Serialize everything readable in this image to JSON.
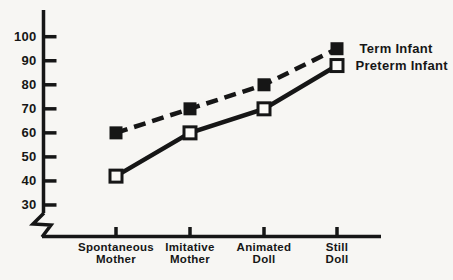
{
  "figure": {
    "background_color": "#f7f6f3",
    "ink_color": "#161616",
    "open_marker_fill": "#fbfaf7"
  },
  "chart_data": {
    "type": "line",
    "title": "",
    "xlabel": "",
    "ylabel": "",
    "categories": [
      "Spontaneous Mother",
      "Imitative Mother",
      "Animated Doll",
      "Still Doll"
    ],
    "category_label_lines": [
      [
        "Spontaneous",
        "Mother"
      ],
      [
        "Imitative",
        "Mother"
      ],
      [
        "Animated",
        "Doll"
      ],
      [
        "Still",
        "Doll"
      ]
    ],
    "series": [
      {
        "name": "Term Infant",
        "values": [
          60,
          70,
          80,
          95
        ],
        "line_style": "dashed",
        "marker": "filled-square"
      },
      {
        "name": "Preterm Infant",
        "values": [
          42,
          60,
          70,
          88
        ],
        "line_style": "solid",
        "marker": "open-square"
      }
    ],
    "y_ticks": [
      100,
      90,
      80,
      70,
      60,
      50,
      40,
      30
    ],
    "ylim": [
      30,
      107
    ],
    "y_axis_break": true,
    "grid": false,
    "legend_position": "line-end-labels"
  }
}
